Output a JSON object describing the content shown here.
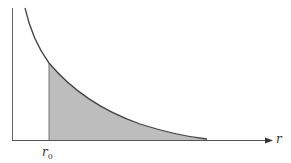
{
  "diagram": {
    "type": "shaded-area-under-decreasing-curve",
    "x_axis": {
      "label": "r",
      "arrow": true
    },
    "y_axis": {
      "label": "",
      "arrow": false
    },
    "boundary": {
      "label_main": "r",
      "label_sub": "0"
    },
    "curve": {
      "shape": "monotonically decreasing, convex, asymptotic to x-axis"
    },
    "shaded_region": {
      "from": "r0",
      "to": "tail of curve",
      "meaning": "area under curve for r > r0"
    },
    "colors": {
      "axis": "#555555",
      "curve": "#444444",
      "shade": "#bdbdbd",
      "background": "#ffffff"
    }
  }
}
